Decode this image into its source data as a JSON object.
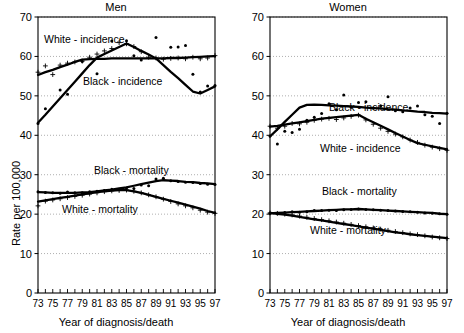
{
  "figure": {
    "xlabel": "Year of diagnosis/death",
    "ylabel": "Rate per 100,000"
  },
  "panels": [
    {
      "title": "Men"
    },
    {
      "title": "Women"
    }
  ],
  "series_labels": {
    "white_incidence": "White - incidence",
    "black_incidence": "Black - incidence",
    "black_mortality": "Black - mortality",
    "white_mortality": "White - mortality"
  },
  "chart_data": [
    {
      "type": "line",
      "title": "Men",
      "xlabel": "Year of diagnosis/death",
      "ylabel": "Rate per 100,000",
      "xlim": [
        73,
        97
      ],
      "ylim": [
        0,
        70
      ],
      "ytick_labels": [
        "0",
        "10",
        "20",
        "30",
        "40",
        "50",
        "60",
        "70"
      ],
      "yticks": [
        0,
        10,
        20,
        30,
        40,
        50,
        60,
        70
      ],
      "xtick_labels": [
        "73",
        "75",
        "77",
        "79",
        "81",
        "83",
        "85",
        "87",
        "89",
        "91",
        "93",
        "95",
        "97"
      ],
      "xticks": [
        73,
        75,
        77,
        79,
        81,
        83,
        85,
        87,
        89,
        91,
        93,
        95,
        97
      ],
      "minor_xticks_every": 1,
      "grid": "horizontal-dotted",
      "legend": "inline-annotations",
      "x": [
        73,
        74,
        75,
        76,
        77,
        78,
        79,
        80,
        81,
        82,
        83,
        84,
        85,
        86,
        87,
        88,
        89,
        90,
        91,
        92,
        93,
        94,
        95,
        96,
        97
      ],
      "series": [
        {
          "name": "White - incidence",
          "marker": "plus",
          "observed": [
            56.0,
            57.6,
            55.4,
            57.8,
            58.3,
            58.6,
            58.8,
            59.8,
            60.6,
            61.4,
            62.0,
            63.5,
            63.2,
            62.5,
            61.2,
            59.8,
            59.6,
            59.3,
            59.5,
            59.6,
            59.4,
            59.8,
            59.4,
            59.6,
            60.2
          ],
          "fitted": [
            55.3,
            56.0,
            56.6,
            57.3,
            57.9,
            58.6,
            59.2,
            59.3,
            59.4,
            59.4,
            59.5,
            59.5,
            59.5,
            59.5,
            59.5,
            59.5,
            59.5,
            59.5,
            59.6,
            59.6,
            59.7,
            59.8,
            59.9,
            60.0,
            60.1
          ]
        },
        {
          "name": "Black - incidence",
          "marker": "dot",
          "observed": [
            43.0,
            46.7,
            null,
            51.5,
            50.4,
            null,
            58.7,
            null,
            55.6,
            null,
            63.9,
            null,
            64.0,
            60.2,
            59.1,
            null,
            64.8,
            null,
            62.3,
            62.4,
            62.8,
            55.5,
            51.0,
            52.5,
            52.6
          ],
          "fitted": [
            43.2,
            45.2,
            47.3,
            49.4,
            51.5,
            53.6,
            55.7,
            57.8,
            59.7,
            60.6,
            61.5,
            62.4,
            63.3,
            62.4,
            61.4,
            60.5,
            59.5,
            57.8,
            56.1,
            54.5,
            52.8,
            51.1,
            50.6,
            51.5,
            52.4
          ]
        },
        {
          "name": "Black - mortality",
          "marker": "dot",
          "observed": [
            25.7,
            25.5,
            25.4,
            25.3,
            25.6,
            25.4,
            25.4,
            25.7,
            25.8,
            26.0,
            26.3,
            26.2,
            26.6,
            26.5,
            27.4,
            27.2,
            28.9,
            29.1,
            28.5,
            28.3,
            28.1,
            28.0,
            27.8,
            27.6,
            27.5
          ],
          "fitted": [
            25.6,
            25.5,
            25.4,
            25.4,
            25.4,
            25.4,
            25.5,
            25.6,
            25.8,
            26.0,
            26.2,
            26.5,
            26.8,
            27.2,
            27.6,
            28.0,
            28.4,
            28.6,
            28.5,
            28.4,
            28.2,
            28.1,
            27.9,
            27.8,
            27.6
          ]
        },
        {
          "name": "White - mortality",
          "marker": "plus",
          "observed": [
            22.1,
            23.3,
            23.6,
            23.9,
            24.2,
            24.5,
            24.8,
            25.1,
            25.4,
            25.7,
            25.9,
            26.0,
            26.1,
            25.8,
            25.4,
            24.9,
            24.4,
            23.8,
            23.2,
            22.6,
            22.1,
            21.6,
            21.0,
            20.5,
            20.2
          ],
          "fitted": [
            23.2,
            23.5,
            23.8,
            24.1,
            24.4,
            24.7,
            25.0,
            25.3,
            25.6,
            25.8,
            26.0,
            26.1,
            26.1,
            25.8,
            25.4,
            24.9,
            24.4,
            23.9,
            23.4,
            22.9,
            22.4,
            21.9,
            21.4,
            20.8,
            20.3
          ]
        }
      ]
    },
    {
      "type": "line",
      "title": "Women",
      "xlabel": "Year of diagnosis/death",
      "ylabel": "Rate per 100,000",
      "xlim": [
        73,
        97
      ],
      "ylim": [
        0,
        70
      ],
      "ytick_labels": [
        "0",
        "10",
        "20",
        "30",
        "40",
        "50",
        "60",
        "70"
      ],
      "yticks": [
        0,
        10,
        20,
        30,
        40,
        50,
        60,
        70
      ],
      "xtick_labels": [
        "73",
        "75",
        "77",
        "79",
        "81",
        "83",
        "85",
        "87",
        "89",
        "91",
        "93",
        "95",
        "97"
      ],
      "xticks": [
        73,
        75,
        77,
        79,
        81,
        83,
        85,
        87,
        89,
        91,
        93,
        95,
        97
      ],
      "minor_xticks_every": 1,
      "grid": "horizontal-dotted",
      "legend": "inline-annotations",
      "x": [
        73,
        74,
        75,
        76,
        77,
        78,
        79,
        80,
        81,
        82,
        83,
        84,
        85,
        86,
        87,
        88,
        89,
        90,
        91,
        92,
        93,
        94,
        95,
        96,
        97
      ],
      "series": [
        {
          "name": "Black - incidence",
          "marker": "dot",
          "observed": [
            39.8,
            37.8,
            41.0,
            40.7,
            41.5,
            43.8,
            44.6,
            45.5,
            48.0,
            46.5,
            50.2,
            47.2,
            48.3,
            48.5,
            46.9,
            47.5,
            49.8,
            46.2,
            46.0,
            46.9,
            47.4,
            45.2,
            44.8,
            43.0,
            45.6
          ],
          "fitted": [
            39.7,
            41.5,
            43.4,
            45.2,
            47.0,
            47.7,
            47.8,
            47.7,
            47.6,
            47.5,
            47.4,
            47.3,
            47.2,
            47.0,
            46.9,
            46.8,
            46.6,
            46.5,
            46.3,
            46.2,
            46.0,
            45.9,
            45.7,
            45.6,
            45.5
          ]
        },
        {
          "name": "White - incidence",
          "marker": "plus",
          "observed": [
            42.3,
            41.8,
            42.3,
            43.0,
            42.9,
            43.3,
            43.8,
            44.1,
            44.3,
            44.0,
            44.4,
            44.8,
            45.1,
            43.9,
            42.8,
            41.8,
            41.0,
            40.3,
            39.6,
            38.8,
            38.2,
            37.5,
            37.0,
            36.6,
            36.2
          ],
          "fitted": [
            42.2,
            42.4,
            42.7,
            43.0,
            43.3,
            43.6,
            43.9,
            44.2,
            44.4,
            44.6,
            44.8,
            45.0,
            45.2,
            44.2,
            43.3,
            42.4,
            41.5,
            40.6,
            39.7,
            38.8,
            38.0,
            37.6,
            37.2,
            36.8,
            36.4
          ]
        },
        {
          "name": "Black - mortality",
          "marker": "dot",
          "observed": [
            20.2,
            20.1,
            20.4,
            20.6,
            20.5,
            20.6,
            20.9,
            20.9,
            21.0,
            20.9,
            21.1,
            21.2,
            21.3,
            21.2,
            21.1,
            21.0,
            20.9,
            20.8,
            20.7,
            20.6,
            20.5,
            20.3,
            20.2,
            20.1,
            20.0
          ],
          "fitted": [
            20.2,
            20.3,
            20.4,
            20.5,
            20.6,
            20.7,
            20.8,
            20.9,
            21.0,
            21.1,
            21.2,
            21.2,
            21.3,
            21.2,
            21.1,
            21.0,
            20.9,
            20.8,
            20.7,
            20.6,
            20.5,
            20.4,
            20.3,
            20.1,
            20.0
          ]
        },
        {
          "name": "White - mortality",
          "marker": "plus",
          "observed": [
            20.3,
            20.2,
            20.0,
            19.8,
            19.5,
            19.2,
            18.9,
            18.6,
            18.3,
            18.0,
            17.7,
            17.4,
            17.1,
            16.8,
            16.5,
            16.2,
            15.9,
            15.6,
            15.3,
            15.0,
            14.8,
            14.5,
            14.2,
            14.0,
            13.8
          ],
          "fitted": [
            20.3,
            20.1,
            19.9,
            19.6,
            19.3,
            19.0,
            18.7,
            18.4,
            18.1,
            17.8,
            17.5,
            17.2,
            16.9,
            16.6,
            16.3,
            16.0,
            15.7,
            15.4,
            15.2,
            14.9,
            14.7,
            14.5,
            14.3,
            14.1,
            13.9
          ]
        }
      ]
    }
  ]
}
